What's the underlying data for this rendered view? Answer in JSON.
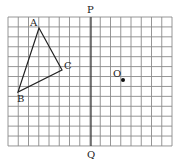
{
  "diagram": {
    "type": "grid-geometry",
    "grid": {
      "x0": 8,
      "y0": 17,
      "cols": 16,
      "rows": 13,
      "cell_w": 10.25,
      "cell_h": 9.92,
      "line_color": "#8a8a8a"
    },
    "axis": {
      "label_top": "P",
      "label_bottom": "Q",
      "x": 91,
      "color": "#333333"
    },
    "triangle": {
      "stroke": "#222222",
      "vertices": [
        {
          "name": "A",
          "x": 39,
          "y": 28,
          "label_dx": -9,
          "label_dy": -2
        },
        {
          "name": "C",
          "x": 62,
          "y": 70,
          "label_dx": 2,
          "label_dy": -1
        },
        {
          "name": "B",
          "x": 18,
          "y": 92,
          "label_dx": -1,
          "label_dy": 10
        }
      ]
    },
    "point": {
      "name": "O",
      "x": 123,
      "y": 80,
      "label_dx": -10,
      "label_dy": -3,
      "color": "#111111"
    }
  }
}
